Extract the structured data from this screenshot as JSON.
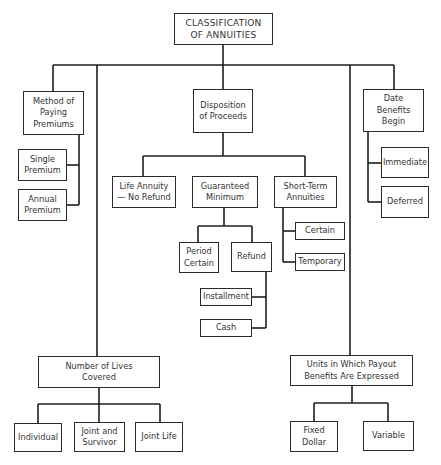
{
  "diagram": {
    "title": "CLASSIFICATION\nOF ANNUITIES",
    "categories": {
      "method_of_paying": {
        "label": "Method of\nPaying\nPremiums",
        "children": [
          "Single\nPremium",
          "Annual\nPremium"
        ]
      },
      "disposition": {
        "label": "Disposition\nof Proceeds",
        "children": {
          "life_annuity": "Life Annuity\n— No Refund",
          "guaranteed_minimum": {
            "label": "Guaranteed\nMinimum",
            "period_certain": "Period\nCertain",
            "refund": {
              "label": "Refund",
              "children": [
                "Installment",
                "Cash"
              ]
            }
          },
          "short_term": {
            "label": "Short-Term\nAnnuities",
            "children": [
              "Certain",
              "Temporary"
            ]
          }
        }
      },
      "date_benefits": {
        "label": "Date\nBenefits\nBegin",
        "children": [
          "Immediate",
          "Deferred"
        ]
      },
      "number_of_lives": {
        "label": "Number of Lives\nCovered",
        "children": [
          "Individual",
          "Joint and\nSurvivor",
          "Joint Life"
        ]
      },
      "units_payout": {
        "label": "Units in Which Payout\nBenefits Are Expressed",
        "children": [
          "Fixed\nDollar",
          "Variable"
        ]
      }
    }
  }
}
